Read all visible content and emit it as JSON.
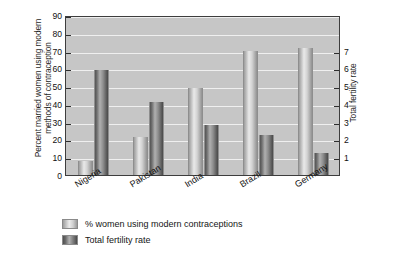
{
  "chart_data": {
    "type": "bar",
    "title": "",
    "categories": [
      "Nigeria",
      "Pakistan",
      "India",
      "Brazil",
      "Germany"
    ],
    "series": [
      {
        "name": "% women using modern contraceptions",
        "axis": "left",
        "color": "#d3d3d3",
        "values": [
          8,
          21.5,
          49,
          70,
          71.5
        ]
      },
      {
        "name": "Total fertility rate",
        "axis": "right",
        "color": "#6e6e6e",
        "values": [
          5.9,
          4.1,
          2.8,
          2.25,
          1.25
        ]
      }
    ],
    "xlabel": "",
    "ylabel": "Percent married women using modern methods of contraception",
    "y2label": "Total fertility rate",
    "ylim": [
      0,
      90
    ],
    "y2lim": [
      0,
      9
    ],
    "yticks": [
      0,
      10,
      20,
      30,
      40,
      50,
      60,
      70,
      80,
      90
    ],
    "yticklabels": [
      "0",
      "10",
      "20",
      "30",
      "40",
      "50",
      "60",
      "70",
      "80",
      "90"
    ],
    "y2ticks": [
      1,
      2,
      3,
      4,
      5,
      6,
      7
    ],
    "y2ticklabels": [
      "1",
      "2",
      "3",
      "4",
      "5",
      "6",
      "7"
    ],
    "grid": true,
    "gridaxis": "y",
    "legend_position": "below-left",
    "plot_background": "#c6c6c6"
  },
  "axes": {
    "left_title_line1": "Percent married women using modern",
    "left_title_line2": "methods of contraception",
    "right_title": "Total fertility rate"
  },
  "legend": {
    "items": [
      {
        "label": "% women using modern contraceptions",
        "swatch": "light"
      },
      {
        "label": "Total fertility rate",
        "swatch": "dark"
      }
    ]
  }
}
